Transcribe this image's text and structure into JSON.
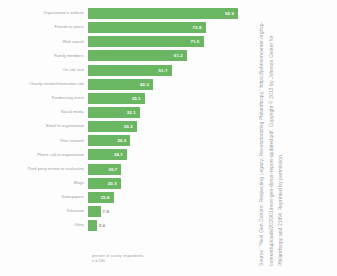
{
  "chart_data": {
    "type": "bar",
    "orientation": "horizontal",
    "title": "",
    "xlabel": "percent of survey respondents",
    "ylabel": "",
    "xlim": [
      0,
      100
    ],
    "grid": false,
    "legend": "none",
    "bar_color": "#6ab662",
    "categories": [
      "Organization's website",
      "Friends or peers",
      "Web search",
      "Family members",
      "On-site visit",
      "Charity review/information site",
      "Fundraising event",
      "Social media",
      "Email to organization",
      "Peer network",
      "Phone call to organization",
      "Third party review or evaluation",
      "Blogs",
      "Newspapers",
      "Television",
      "Other"
    ],
    "values": [
      92.9,
      72.8,
      71.5,
      61.2,
      51.7,
      40.3,
      35.1,
      32.1,
      30.2,
      26.3,
      24.1,
      20.7,
      20.3,
      15.8,
      7.8,
      5.6
    ],
    "value_labels": [
      "92.9",
      "72.8",
      "71.5",
      "61.2",
      "51.7",
      "40.3",
      "35.1",
      "32.1",
      "30.2",
      "26.3",
      "24.1",
      "20.7",
      "20.3",
      "15.8",
      "7.8",
      "5.6"
    ]
  },
  "footnote": {
    "line1": "percent of survey respondents",
    "line2": "n = 280"
  },
  "source": {
    "text": "Source: \"Next Gen Donors: Respecting Legacy, Revolutionizing Philanthropy,\" https://johnsoncenter.org/wp-content/uploads/2020/01/next-gen-donor-report-updated.pdf. Copyright © 2013 by Johnson Center for Philanthropy and 21/64. Reprinted by permission."
  }
}
